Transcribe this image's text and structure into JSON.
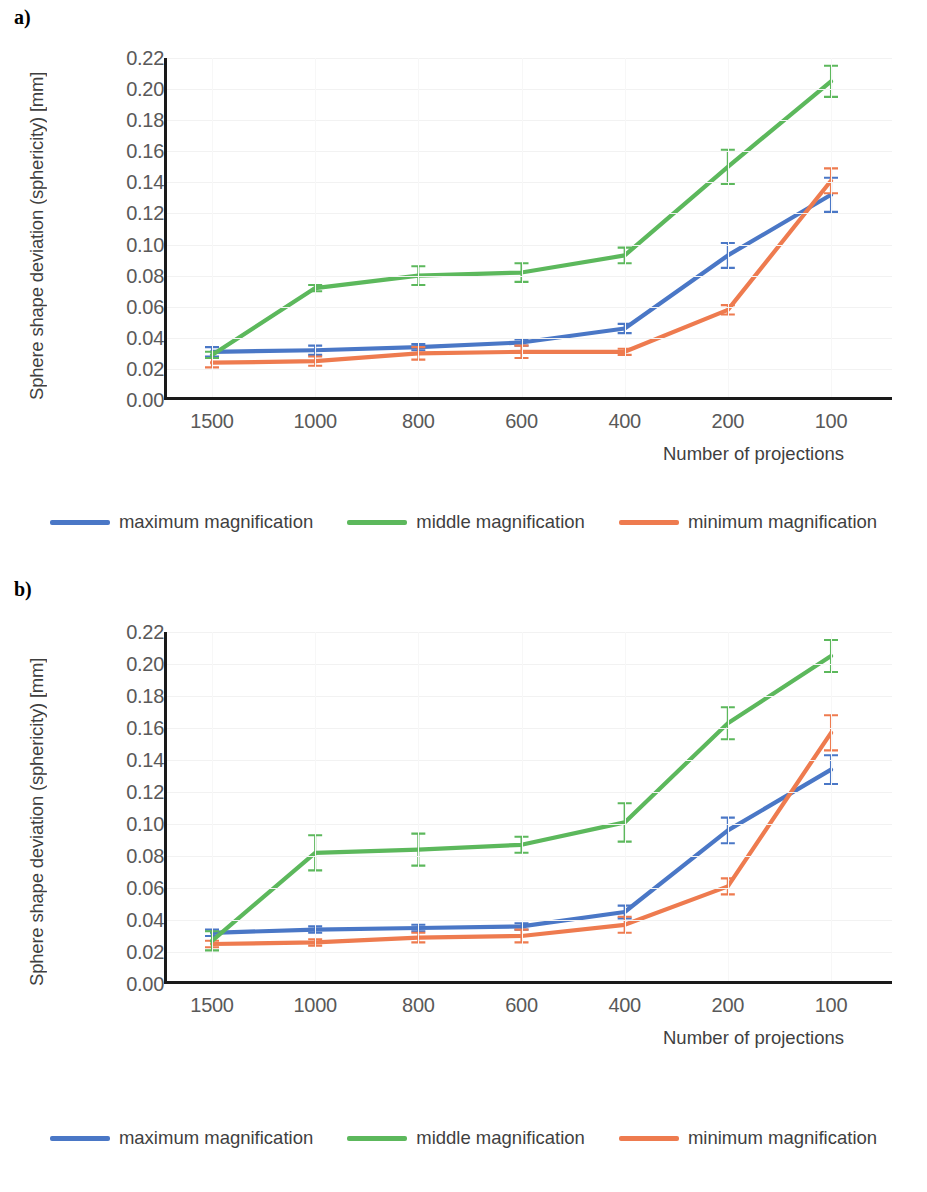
{
  "figure": {
    "panels": [
      {
        "label": "a)"
      },
      {
        "label": "b)"
      }
    ],
    "legend_items": [
      {
        "name": "maximum magnification",
        "color": "#4a77c6"
      },
      {
        "name": "middle magnification",
        "color": "#5cb85c"
      },
      {
        "name": "minimum magnification",
        "color": "#ee7b4f"
      }
    ]
  },
  "chart_data": [
    {
      "panel": "a)",
      "type": "line",
      "title": "",
      "xlabel": "Number of projections",
      "ylabel": "Sphere shape deviation (sphericity) [mm]",
      "categories": [
        "1500",
        "1000",
        "800",
        "600",
        "400",
        "200",
        "100"
      ],
      "ytick_labels": [
        "0.00",
        "0.02",
        "0.04",
        "0.06",
        "0.08",
        "0.10",
        "0.12",
        "0.14",
        "0.16",
        "0.18",
        "0.20",
        "0.22"
      ],
      "ylim": [
        0.0,
        0.22
      ],
      "ytick_step": 0.02,
      "grid": true,
      "legend_position": "bottom",
      "series": [
        {
          "name": "maximum magnification",
          "color": "#4a77c6",
          "values": [
            0.031,
            0.032,
            0.034,
            0.037,
            0.046,
            0.093,
            0.132
          ],
          "errors": [
            0.003,
            0.003,
            0.002,
            0.002,
            0.003,
            0.008,
            0.011
          ]
        },
        {
          "name": "middle magnification",
          "color": "#5cb85c",
          "values": [
            0.029,
            0.072,
            0.08,
            0.082,
            0.093,
            0.15,
            0.205
          ],
          "errors": [
            0.002,
            0.002,
            0.006,
            0.006,
            0.005,
            0.011,
            0.01
          ]
        },
        {
          "name": "minimum magnification",
          "color": "#ee7b4f",
          "values": [
            0.024,
            0.025,
            0.03,
            0.031,
            0.031,
            0.058,
            0.141
          ],
          "errors": [
            0.003,
            0.003,
            0.004,
            0.004,
            0.002,
            0.003,
            0.008
          ]
        }
      ]
    },
    {
      "panel": "b)",
      "type": "line",
      "title": "",
      "xlabel": "Number of projections",
      "ylabel": "Sphere shape deviation (sphericity) [mm]",
      "categories": [
        "1500",
        "1000",
        "800",
        "600",
        "400",
        "200",
        "100"
      ],
      "ytick_labels": [
        "0.00",
        "0.02",
        "0.04",
        "0.06",
        "0.08",
        "0.10",
        "0.12",
        "0.14",
        "0.16",
        "0.18",
        "0.20",
        "0.22"
      ],
      "ylim": [
        0.0,
        0.22
      ],
      "ytick_step": 0.02,
      "grid": true,
      "legend_position": "bottom",
      "series": [
        {
          "name": "maximum magnification",
          "color": "#4a77c6",
          "values": [
            0.032,
            0.034,
            0.035,
            0.036,
            0.045,
            0.096,
            0.134
          ],
          "errors": [
            0.002,
            0.002,
            0.002,
            0.002,
            0.004,
            0.008,
            0.009
          ]
        },
        {
          "name": "middle magnification",
          "color": "#5cb85c",
          "values": [
            0.027,
            0.082,
            0.084,
            0.087,
            0.101,
            0.163,
            0.205
          ],
          "errors": [
            0.006,
            0.011,
            0.01,
            0.005,
            0.012,
            0.01,
            0.01
          ]
        },
        {
          "name": "minimum magnification",
          "color": "#ee7b4f",
          "values": [
            0.025,
            0.026,
            0.029,
            0.03,
            0.037,
            0.061,
            0.157
          ],
          "errors": [
            0.002,
            0.002,
            0.003,
            0.004,
            0.005,
            0.005,
            0.011
          ]
        }
      ]
    }
  ]
}
